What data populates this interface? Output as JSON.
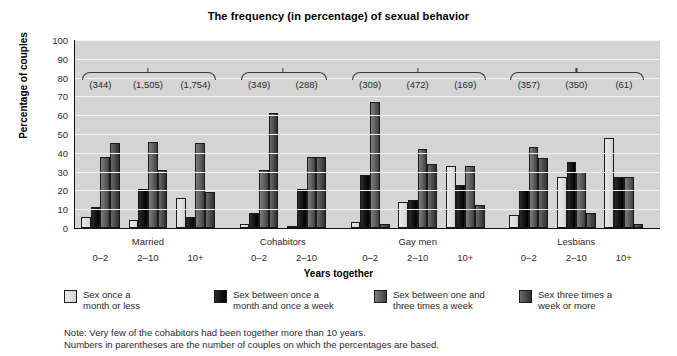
{
  "chart_data": {
    "type": "bar",
    "title": "The frequency (in percentage) of sexual behavior",
    "xlabel": "Years together",
    "ylabel": "Percentage of couples",
    "ylim": [
      0,
      100
    ],
    "ytick_labels": [
      "0",
      "10",
      "20",
      "30",
      "40",
      "50",
      "60",
      "70",
      "80",
      "90",
      "100"
    ],
    "grid": true,
    "legend_position": "bottom",
    "categories": [
      "0–2",
      "2–10",
      "10+",
      "0–2",
      "2–10",
      "0–2",
      "2–10",
      "10+",
      "0–2",
      "2–10",
      "10+"
    ],
    "groups": [
      {
        "label": "Married",
        "subcategories": [
          "0–2",
          "2–10",
          "10+"
        ],
        "n": [
          "(344)",
          "(1,505)",
          "(1,754)"
        ]
      },
      {
        "label": "Cohabitors",
        "subcategories": [
          "0–2",
          "2–10"
        ],
        "n": [
          "(349)",
          "(288)"
        ]
      },
      {
        "label": "Gay men",
        "subcategories": [
          "0–2",
          "2–10",
          "10+"
        ],
        "n": [
          "(309)",
          "(472)",
          "(169)"
        ]
      },
      {
        "label": "Lesbians",
        "subcategories": [
          "0–2",
          "2–10",
          "10+"
        ],
        "n": [
          "(357)",
          "(350)",
          "(61)"
        ]
      }
    ],
    "series": [
      {
        "name": "Sex once a month or less",
        "color": "#dedede",
        "values": [
          6,
          4,
          16,
          2,
          1,
          3,
          14,
          33,
          7,
          27,
          48
        ]
      },
      {
        "name": "Sex between once a month and once a week",
        "color": "#141414",
        "values": [
          11,
          21,
          6,
          8,
          21,
          28,
          15,
          23,
          20,
          35,
          27
        ]
      },
      {
        "name": "Sex between one and three times a week",
        "color": "#5e5e5e",
        "values": [
          38,
          46,
          45,
          31,
          38,
          67,
          42,
          33,
          43,
          30,
          27
        ]
      },
      {
        "name": "Sex three times a week or more",
        "color": "#4a4a4a",
        "values": [
          45,
          31,
          19,
          61,
          38,
          2,
          34,
          12,
          37,
          8,
          2
        ]
      }
    ],
    "notes": [
      "Note: Very few of the cohabitors had been together more than 10 years.",
      "Numbers in parentheses are the number of couples on which the percentages are based."
    ]
  }
}
